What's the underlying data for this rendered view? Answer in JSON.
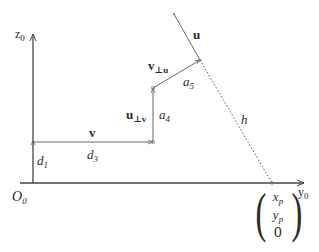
{
  "diagram": {
    "type": "geometric-vector-diagram",
    "axes": {
      "vertical": {
        "label": "z",
        "subscript": "0"
      },
      "horizontal": {
        "label": "y",
        "subscript": "0"
      },
      "origin": {
        "label": "O",
        "subscript": "0"
      }
    },
    "vectors": {
      "v": {
        "label": "v"
      },
      "u_perp_v": {
        "label": "u",
        "subscript": "⊥v"
      },
      "v_perp_u": {
        "label": "v",
        "subscript": "⊥u"
      },
      "u": {
        "label": "u"
      }
    },
    "lengths": {
      "d1": {
        "label": "d",
        "subscript": "1"
      },
      "d3": {
        "label": "d",
        "subscript": "3"
      },
      "a4": {
        "label": "a",
        "subscript": "4"
      },
      "a5": {
        "label": "a",
        "subscript": "5"
      },
      "h": {
        "label": "h"
      }
    },
    "point": {
      "rows": [
        {
          "label": "x",
          "subscript": "p"
        },
        {
          "label": "y",
          "subscript": "p"
        },
        {
          "label": "0",
          "subscript": ""
        }
      ]
    },
    "colors": {
      "line": "#555555",
      "text": "#2a2a2a",
      "background": "#ffffff"
    }
  }
}
